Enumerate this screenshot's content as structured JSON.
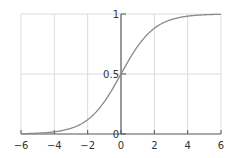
{
  "chart_data": {
    "type": "line",
    "title": "",
    "xlabel": "",
    "ylabel": "",
    "function": "sigmoid: y = 1 / (1 + e^-x)",
    "xlim": [
      -6,
      6
    ],
    "ylim": [
      0,
      1
    ],
    "x_ticks": [
      -6,
      -4,
      -2,
      0,
      2,
      4,
      6
    ],
    "x_tick_labels": [
      "−6",
      "−4",
      "−2",
      "0",
      "2",
      "4",
      "6"
    ],
    "y_ticks": [
      0,
      0.5,
      1
    ],
    "y_tick_labels": [
      "0",
      "0.5",
      "1"
    ],
    "grid": true,
    "legend": null,
    "series": [
      {
        "name": "sigmoid",
        "color": "#8a8a8a",
        "x": [
          -6,
          -5,
          -4,
          -3,
          -2,
          -1,
          0,
          1,
          2,
          3,
          4,
          5,
          6
        ],
        "y": [
          0.0025,
          0.0067,
          0.018,
          0.047,
          0.119,
          0.269,
          0.5,
          0.731,
          0.881,
          0.953,
          0.982,
          0.9933,
          0.9975
        ]
      }
    ]
  },
  "colors": {
    "grid": "#dcdcdc",
    "axis": "#555555",
    "curve": "#8a8a8a",
    "text": "#333333"
  }
}
